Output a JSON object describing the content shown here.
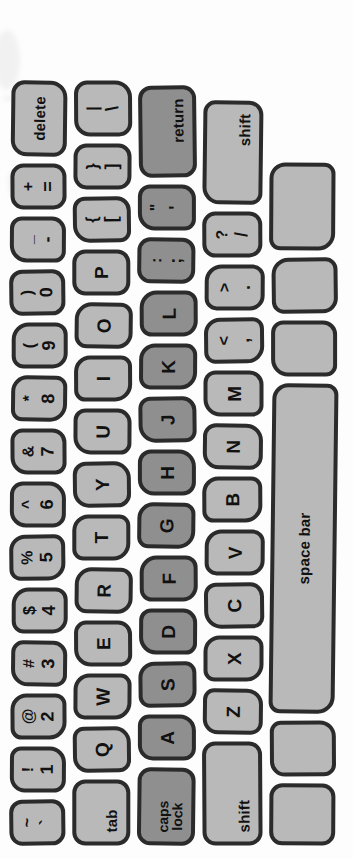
{
  "artwork": {
    "title": "Hand-drawn Macintosh keyboard illustration",
    "orientation": "rotated-90-ccw",
    "colors": {
      "background": "#fdfdfd",
      "key_light": "#b9b9b9",
      "key_dark": "#8f8f8f",
      "outline": "#2b2b2b",
      "glyph": "#111111"
    }
  },
  "keyboard": {
    "rows": [
      {
        "name": "number-row",
        "keys": [
          {
            "name": "key-backtick",
            "up": "~",
            "down": "`",
            "type": "dual",
            "shade": "light",
            "w": 46
          },
          {
            "name": "key-1",
            "up": "!",
            "down": "1",
            "type": "dual",
            "shade": "light",
            "w": 46
          },
          {
            "name": "key-2",
            "up": "@",
            "down": "2",
            "type": "dual",
            "shade": "light",
            "w": 46
          },
          {
            "name": "key-3",
            "up": "#",
            "down": "3",
            "type": "dual",
            "shade": "light",
            "w": 46
          },
          {
            "name": "key-4",
            "up": "$",
            "down": "4",
            "type": "dual",
            "shade": "light",
            "w": 46
          },
          {
            "name": "key-5",
            "up": "%",
            "down": "5",
            "type": "dual",
            "shade": "light",
            "w": 46
          },
          {
            "name": "key-6",
            "up": "^",
            "down": "6",
            "type": "dual",
            "shade": "light",
            "w": 46
          },
          {
            "name": "key-7",
            "up": "&",
            "down": "7",
            "type": "dual",
            "shade": "light",
            "w": 46
          },
          {
            "name": "key-8",
            "up": "*",
            "down": "8",
            "type": "dual",
            "shade": "light",
            "w": 46
          },
          {
            "name": "key-9",
            "up": "(",
            "down": "9",
            "type": "dual",
            "shade": "light",
            "w": 46
          },
          {
            "name": "key-0",
            "up": ")",
            "down": "0",
            "type": "dual",
            "shade": "light",
            "w": 46
          },
          {
            "name": "key-minus",
            "up": "_",
            "down": "-",
            "type": "dual",
            "shade": "light",
            "w": 46
          },
          {
            "name": "key-equal",
            "up": "+",
            "down": "=",
            "type": "dual",
            "shade": "light",
            "w": 46
          },
          {
            "name": "key-delete",
            "label": "delete",
            "type": "word",
            "shade": "light",
            "w": 76
          }
        ]
      },
      {
        "name": "top-letter-row",
        "keys": [
          {
            "name": "key-tab",
            "label": "tab",
            "type": "word",
            "shade": "light",
            "w": 66,
            "align": "left"
          },
          {
            "name": "key-q",
            "label": "Q",
            "type": "letter",
            "shade": "light",
            "w": 46
          },
          {
            "name": "key-w",
            "label": "W",
            "type": "letter",
            "shade": "light",
            "w": 46
          },
          {
            "name": "key-e",
            "label": "E",
            "type": "letter",
            "shade": "light",
            "w": 46
          },
          {
            "name": "key-r",
            "label": "R",
            "type": "letter",
            "shade": "light",
            "w": 46
          },
          {
            "name": "key-t",
            "label": "T",
            "type": "letter",
            "shade": "light",
            "w": 46
          },
          {
            "name": "key-y",
            "label": "Y",
            "type": "letter",
            "shade": "light",
            "w": 46
          },
          {
            "name": "key-u",
            "label": "U",
            "type": "letter",
            "shade": "light",
            "w": 46
          },
          {
            "name": "key-i",
            "label": "I",
            "type": "letter",
            "shade": "light",
            "w": 46
          },
          {
            "name": "key-o",
            "label": "O",
            "type": "letter",
            "shade": "light",
            "w": 46
          },
          {
            "name": "key-p",
            "label": "P",
            "type": "letter",
            "shade": "light",
            "w": 46
          },
          {
            "name": "key-bracket-left",
            "up": "{",
            "down": "[",
            "type": "dual",
            "shade": "light",
            "w": 46
          },
          {
            "name": "key-bracket-right",
            "up": "}",
            "down": "]",
            "type": "dual",
            "shade": "light",
            "w": 46
          },
          {
            "name": "key-backslash",
            "up": "|",
            "down": "\\",
            "type": "dual",
            "shade": "light",
            "w": 56
          }
        ]
      },
      {
        "name": "home-row",
        "keys": [
          {
            "name": "key-caps-lock",
            "label_lines": [
              "caps",
              "lock"
            ],
            "type": "stack",
            "shade": "dark",
            "w": 78,
            "align": "left"
          },
          {
            "name": "key-a",
            "label": "A",
            "type": "letter",
            "shade": "dark",
            "w": 46
          },
          {
            "name": "key-s",
            "label": "S",
            "type": "letter",
            "shade": "dark",
            "w": 46
          },
          {
            "name": "key-d",
            "label": "D",
            "type": "letter",
            "shade": "dark",
            "w": 46
          },
          {
            "name": "key-f",
            "label": "F",
            "type": "letter",
            "shade": "dark",
            "w": 46
          },
          {
            "name": "key-g",
            "label": "G",
            "type": "letter",
            "shade": "dark",
            "w": 46
          },
          {
            "name": "key-h",
            "label": "H",
            "type": "letter",
            "shade": "dark",
            "w": 46
          },
          {
            "name": "key-j",
            "label": "J",
            "type": "letter",
            "shade": "dark",
            "w": 46
          },
          {
            "name": "key-k",
            "label": "K",
            "type": "letter",
            "shade": "dark",
            "w": 46
          },
          {
            "name": "key-l",
            "label": "L",
            "type": "letter",
            "shade": "dark",
            "w": 46
          },
          {
            "name": "key-semicolon",
            "up": ":",
            "down": ";",
            "type": "dual",
            "shade": "dark",
            "w": 46
          },
          {
            "name": "key-quote",
            "up": "\"",
            "down": "'",
            "type": "dual",
            "shade": "dark",
            "w": 46
          },
          {
            "name": "key-return",
            "label": "return",
            "type": "word",
            "shade": "dark",
            "w": 92,
            "align": "right"
          }
        ]
      },
      {
        "name": "bottom-letter-row",
        "keys": [
          {
            "name": "key-shift-left",
            "label": "shift",
            "type": "word",
            "shade": "light",
            "w": 104,
            "align": "left"
          },
          {
            "name": "key-z",
            "label": "Z",
            "type": "letter",
            "shade": "light",
            "w": 46
          },
          {
            "name": "key-x",
            "label": "X",
            "type": "letter",
            "shade": "light",
            "w": 46
          },
          {
            "name": "key-c",
            "label": "C",
            "type": "letter",
            "shade": "light",
            "w": 46
          },
          {
            "name": "key-v",
            "label": "V",
            "type": "letter",
            "shade": "light",
            "w": 46
          },
          {
            "name": "key-b",
            "label": "B",
            "type": "letter",
            "shade": "light",
            "w": 46
          },
          {
            "name": "key-n",
            "label": "N",
            "type": "letter",
            "shade": "light",
            "w": 46
          },
          {
            "name": "key-m",
            "label": "M",
            "type": "letter",
            "shade": "light",
            "w": 46
          },
          {
            "name": "key-comma",
            "up": "<",
            "down": ",",
            "type": "dual",
            "shade": "light",
            "w": 46
          },
          {
            "name": "key-period",
            "up": ">",
            "down": ".",
            "type": "dual",
            "shade": "light",
            "w": 46
          },
          {
            "name": "key-slash",
            "up": "?",
            "down": "/",
            "type": "dual",
            "shade": "light",
            "w": 46
          },
          {
            "name": "key-shift-right",
            "label": "shift",
            "type": "word",
            "shade": "light",
            "w": 104,
            "align": "right"
          }
        ]
      },
      {
        "name": "space-row",
        "keys": [
          {
            "name": "key-blank-1",
            "label": "",
            "type": "blank",
            "shade": "light",
            "w": 62
          },
          {
            "name": "key-blank-2",
            "label": "",
            "type": "blank",
            "shade": "light",
            "w": 56
          },
          {
            "name": "key-space-bar",
            "label": "space bar",
            "type": "word",
            "shade": "light",
            "w": 330
          },
          {
            "name": "key-blank-3",
            "label": "",
            "type": "blank",
            "shade": "light",
            "w": 56
          },
          {
            "name": "key-blank-4",
            "label": "",
            "type": "blank",
            "shade": "light",
            "w": 56
          },
          {
            "name": "key-blank-5",
            "label": "",
            "type": "blank",
            "shade": "light",
            "w": 88
          }
        ]
      }
    ]
  }
}
